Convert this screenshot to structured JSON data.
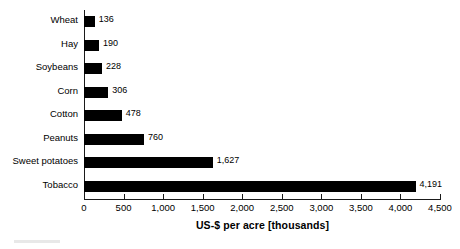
{
  "chart_data": {
    "type": "bar",
    "orientation": "horizontal",
    "title": "",
    "subtitle": "",
    "xlabel": "US-$ per acre [thousands]",
    "ylabel": "",
    "xlim": [
      0,
      4500
    ],
    "grid": false,
    "legend": null,
    "categories": [
      "Wheat",
      "Hay",
      "Soybeans",
      "Corn",
      "Cotton",
      "Peanuts",
      "Sweet potatoes",
      "Tobacco"
    ],
    "values": [
      136,
      190,
      228,
      306,
      478,
      760,
      1627,
      4191
    ],
    "value_labels": [
      "136",
      "190",
      "228",
      "306",
      "478",
      "760",
      "1,627",
      "4,191"
    ],
    "xticks": [
      0,
      500,
      1000,
      1500,
      2000,
      2500,
      3000,
      3500,
      4000,
      4500
    ],
    "xtick_labels": [
      "0",
      "500",
      "1,000",
      "1,500",
      "2,000",
      "2,500",
      "3,000",
      "3,500",
      "4,000",
      "4,500"
    ],
    "bar_color": "#000000",
    "axis_color": "#1a1a1a",
    "background_color": "#ffffff"
  },
  "axis": {
    "x_title": "US-$ per acre [thousands]"
  }
}
